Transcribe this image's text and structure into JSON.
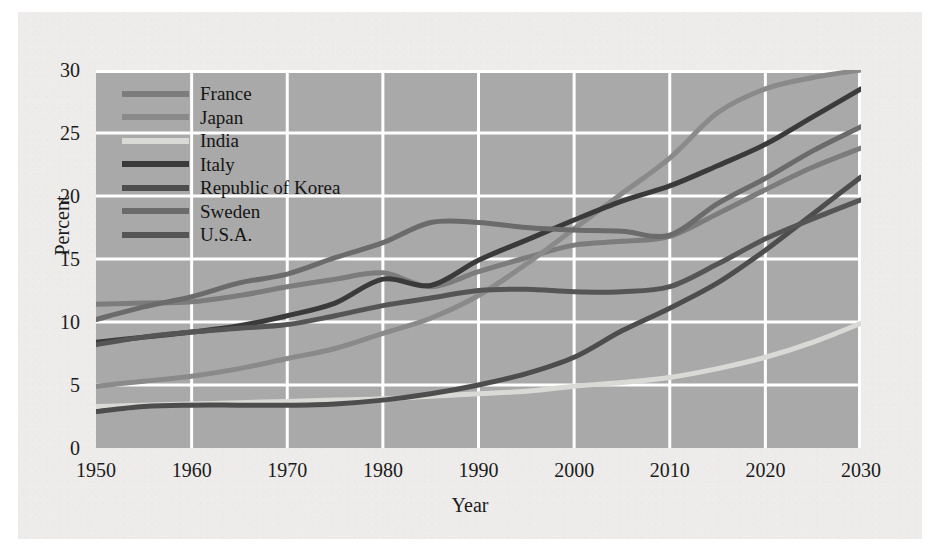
{
  "figure": {
    "background_color": "#eeecea",
    "plot_background_color": "#a9a9a9",
    "gridline_color": "#ffffff"
  },
  "chart_data": {
    "type": "line",
    "title": "",
    "xlabel": "Year",
    "ylabel": "Percent",
    "xlim": [
      1950,
      2030
    ],
    "ylim": [
      0,
      30
    ],
    "xticks": [
      1950,
      1960,
      1970,
      1980,
      1990,
      2000,
      2010,
      2020,
      2030
    ],
    "yticks": [
      0,
      5,
      10,
      15,
      20,
      25,
      30
    ],
    "xtick_labels": [
      "1950",
      "1960",
      "1970",
      "1980",
      "1990",
      "2000",
      "2010",
      "2020",
      "2030"
    ],
    "ytick_labels": [
      "0",
      "5",
      "10",
      "15",
      "20",
      "25",
      "30"
    ],
    "grid": true,
    "legend_position": "upper-left",
    "x": [
      1950,
      1955,
      1960,
      1965,
      1970,
      1975,
      1980,
      1985,
      1990,
      1995,
      2000,
      2005,
      2010,
      2015,
      2020,
      2025,
      2030
    ],
    "series": [
      {
        "name": "France",
        "color": "#7c7c7c",
        "width": 5,
        "values": [
          11.4,
          11.5,
          11.6,
          12.1,
          12.8,
          13.4,
          13.9,
          12.8,
          14.0,
          15.1,
          16.1,
          16.4,
          16.8,
          18.6,
          20.5,
          22.3,
          23.8
        ]
      },
      {
        "name": "Japan",
        "color": "#8a8a8a",
        "width": 5,
        "values": [
          4.9,
          5.3,
          5.7,
          6.3,
          7.1,
          7.9,
          9.1,
          10.3,
          12.1,
          14.6,
          17.4,
          20.2,
          23.0,
          26.6,
          28.5,
          29.4,
          30.0
        ]
      },
      {
        "name": "India",
        "color": "#d9d9d6",
        "width": 5,
        "values": [
          3.3,
          3.4,
          3.5,
          3.6,
          3.7,
          3.8,
          3.9,
          4.1,
          4.3,
          4.5,
          4.9,
          5.2,
          5.6,
          6.3,
          7.2,
          8.4,
          9.9
        ]
      },
      {
        "name": "Italy",
        "color": "#3a3a3a",
        "width": 5,
        "values": [
          8.4,
          8.8,
          9.2,
          9.7,
          10.5,
          11.5,
          13.4,
          12.9,
          14.9,
          16.5,
          18.1,
          19.6,
          20.8,
          22.4,
          24.1,
          26.3,
          28.5
        ]
      },
      {
        "name": "Republic of Korea",
        "color": "#4d4d4d",
        "width": 5,
        "values": [
          2.9,
          3.3,
          3.4,
          3.4,
          3.4,
          3.5,
          3.8,
          4.3,
          5.0,
          5.9,
          7.2,
          9.3,
          11.1,
          13.1,
          15.7,
          18.6,
          21.5
        ]
      },
      {
        "name": "Sweden",
        "color": "#6b6b6b",
        "width": 5,
        "values": [
          10.2,
          11.2,
          12.0,
          13.1,
          13.8,
          15.1,
          16.3,
          17.9,
          17.9,
          17.5,
          17.3,
          17.2,
          16.9,
          19.4,
          21.4,
          23.6,
          25.5
        ]
      },
      {
        "name": "U.S.A.",
        "color": "#555555",
        "width": 5,
        "values": [
          8.2,
          8.8,
          9.2,
          9.5,
          9.8,
          10.5,
          11.3,
          11.9,
          12.5,
          12.6,
          12.4,
          12.4,
          12.8,
          14.6,
          16.6,
          18.2,
          19.7
        ]
      }
    ]
  }
}
